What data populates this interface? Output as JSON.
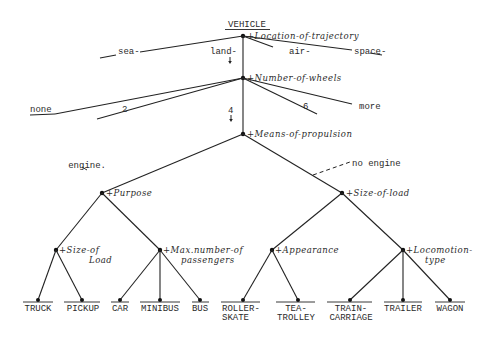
{
  "title": "VEHICLE",
  "root_attribute": "+Location-of-trajectory",
  "trajectory_values": [
    {
      "label": "sea-",
      "x": 120,
      "y": 52
    },
    {
      "label": "land-",
      "x": 212,
      "y": 52
    },
    {
      "label": "air-",
      "x": 290,
      "y": 52
    },
    {
      "label": "space-",
      "x": 356,
      "y": 52
    }
  ],
  "wheels_attribute": "+Number-of-wheels",
  "wheels_values": [
    {
      "label": "none",
      "x": 30,
      "y": 108
    },
    {
      "label": "2",
      "x": 122,
      "y": 108
    },
    {
      "label": "4",
      "x": 230,
      "y": 110
    },
    {
      "label": "6",
      "x": 305,
      "y": 108
    },
    {
      "label": "more",
      "x": 356,
      "y": 108
    }
  ],
  "propulsion_attribute": "+Means-of-propulsion",
  "propulsion_values": {
    "left": "engine.",
    "right": "no engine"
  },
  "level2": {
    "left_attribute": "+Purpose",
    "right_attribute": "+Size-of-load"
  },
  "level3": [
    {
      "line1": "+Size-of",
      "line2": "Load"
    },
    {
      "line1": "+Max.number-of",
      "line2": "passengers"
    },
    {
      "line1": "+Appearance",
      "line2": ""
    },
    {
      "line1": "+Locomotion-",
      "line2": "type"
    }
  ],
  "leaves": [
    {
      "line1": "TRUCK",
      "line2": "",
      "x": 38
    },
    {
      "line1": "PICKUP",
      "line2": "",
      "x": 82
    },
    {
      "line1": "CAR",
      "line2": "",
      "x": 120
    },
    {
      "line1": "MINIBUS",
      "line2": "",
      "x": 160
    },
    {
      "line1": "BUS",
      "line2": "",
      "x": 200
    },
    {
      "line1": "ROLLER-",
      "line2": "SKATE",
      "x": 243
    },
    {
      "line1": "TEA-",
      "line2": "TROLLEY",
      "x": 298
    },
    {
      "line1": "TRAIN-",
      "line2": "CARRIAGE",
      "x": 350
    },
    {
      "line1": "TRAILER",
      "line2": "",
      "x": 403
    },
    {
      "line1": "WAGON",
      "line2": "",
      "x": 450
    }
  ]
}
